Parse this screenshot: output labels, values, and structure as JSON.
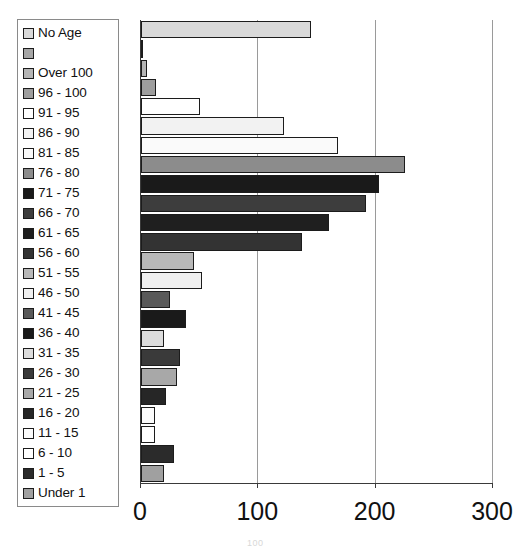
{
  "chart_data": {
    "type": "bar",
    "orientation": "horizontal",
    "title": "",
    "xlabel": "",
    "ylabel": "",
    "xlim": [
      0,
      300
    ],
    "xticks": [
      0,
      100,
      200,
      300
    ],
    "xtick_labels": [
      "0",
      "100",
      "200",
      "300"
    ],
    "grid": "vertical",
    "legend_position": "top-left",
    "categories": [
      "No Age",
      "",
      "Over 100",
      "96 - 100",
      "91 - 95",
      "86 - 90",
      "81 - 85",
      "76 - 80",
      "71 - 75",
      "66 - 70",
      "61 - 65",
      "56 - 60",
      "51 - 55",
      "46 - 50",
      "41 - 45",
      "36 - 40",
      "31 - 35",
      "26 - 30",
      "21 - 25",
      "16 - 20",
      "11 - 15",
      "6 - 10",
      "1 - 5",
      "Under 1"
    ],
    "values": [
      145,
      2,
      5,
      13,
      50,
      122,
      168,
      225,
      203,
      192,
      160,
      137,
      45,
      52,
      25,
      38,
      20,
      33,
      31,
      21,
      12,
      12,
      28,
      20
    ],
    "colors": [
      "#d9d9d9",
      "#a6a6a6",
      "#b5b5b5",
      "#9e9e9e",
      "#ffffff",
      "#f2f2f2",
      "#fafafa",
      "#8c8c8c",
      "#1a1a1a",
      "#3d3d3d",
      "#1f1f1f",
      "#333333",
      "#b8b8b8",
      "#f0f0f0",
      "#595959",
      "#1a1a1a",
      "#dcdcdc",
      "#3a3a3a",
      "#a8a8a8",
      "#262626",
      "#fbfbfb",
      "#ffffff",
      "#2b2b2b",
      "#a0a0a0"
    ]
  },
  "legend": {
    "items": [
      {
        "label": "No Age",
        "swatch": "#d9d9d9"
      },
      {
        "label": "",
        "swatch": "#a6a6a6"
      },
      {
        "label": "Over 100",
        "swatch": "#b5b5b5"
      },
      {
        "label": "96 - 100",
        "swatch": "#9e9e9e"
      },
      {
        "label": "91 - 95",
        "swatch": "#ffffff"
      },
      {
        "label": "86 - 90",
        "swatch": "#f2f2f2"
      },
      {
        "label": "81 - 85",
        "swatch": "#fafafa"
      },
      {
        "label": "76 - 80",
        "swatch": "#8c8c8c"
      },
      {
        "label": "71 - 75",
        "swatch": "#1a1a1a"
      },
      {
        "label": "66 - 70",
        "swatch": "#3d3d3d"
      },
      {
        "label": "61 - 65",
        "swatch": "#1f1f1f"
      },
      {
        "label": "56 - 60",
        "swatch": "#333333"
      },
      {
        "label": "51 - 55",
        "swatch": "#b8b8b8"
      },
      {
        "label": "46 - 50",
        "swatch": "#f0f0f0"
      },
      {
        "label": "41 - 45",
        "swatch": "#595959"
      },
      {
        "label": "36 - 40",
        "swatch": "#1a1a1a"
      },
      {
        "label": "31 - 35",
        "swatch": "#dcdcdc"
      },
      {
        "label": "26 - 30",
        "swatch": "#3a3a3a"
      },
      {
        "label": "21 - 25",
        "swatch": "#a8a8a8"
      },
      {
        "label": "16 - 20",
        "swatch": "#262626"
      },
      {
        "label": "11 - 15",
        "swatch": "#fbfbfb"
      },
      {
        "label": "6 - 10",
        "swatch": "#ffffff"
      },
      {
        "label": "1 - 5",
        "swatch": "#2b2b2b"
      },
      {
        "label": "Under 1",
        "swatch": "#a0a0a0"
      }
    ]
  },
  "artifact": {
    "page_number": "100"
  }
}
